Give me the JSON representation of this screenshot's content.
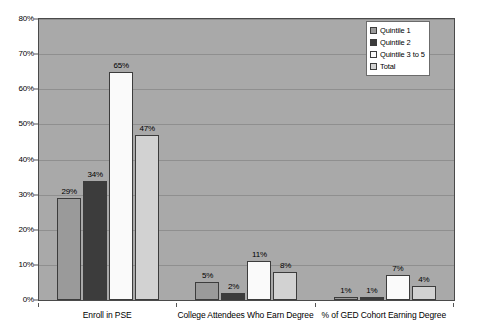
{
  "chart_data": {
    "type": "bar",
    "title": "",
    "xlabel": "",
    "ylabel": "",
    "ylim": [
      0,
      80
    ],
    "ytick_labels": [
      "0%",
      "10%",
      "20%",
      "30%",
      "40%",
      "50%",
      "60%",
      "70%",
      "80%"
    ],
    "ytick_values": [
      0,
      10,
      20,
      30,
      40,
      50,
      60,
      70,
      80
    ],
    "grid": true,
    "legend_position": "top-right",
    "categories": [
      "Enroll in PSE",
      "College Attendees Who Earn Degree",
      "% of GED Cohort Earning Degree"
    ],
    "series": [
      {
        "name": "Quintile 1",
        "color": "#9a9a9a",
        "values": [
          29,
          5,
          1
        ],
        "labels": [
          "29%",
          "5%",
          "1%"
        ]
      },
      {
        "name": "Quintile 2",
        "color": "#3c3c3c",
        "values": [
          34,
          2,
          1
        ],
        "labels": [
          "34%",
          "2%",
          "1%"
        ]
      },
      {
        "name": "Quintile 3 to 5",
        "color": "#fafafa",
        "values": [
          65,
          11,
          7
        ],
        "labels": [
          "65%",
          "11%",
          "7%"
        ]
      },
      {
        "name": "Total",
        "color": "#d2d2d2",
        "values": [
          47,
          8,
          4
        ],
        "labels": [
          "47%",
          "8%",
          "4%"
        ]
      }
    ]
  },
  "legend": {
    "items": [
      {
        "label": "Quintile 1"
      },
      {
        "label": "Quintile 2"
      },
      {
        "label": "Quintile 3 to 5"
      },
      {
        "label": "Total"
      }
    ]
  }
}
